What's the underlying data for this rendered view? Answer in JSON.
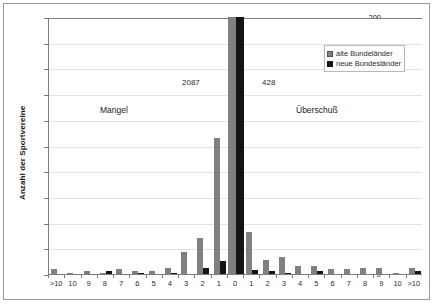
{
  "chart_data": {
    "type": "bar",
    "title": "",
    "xlabel": "",
    "ylabel": "Anzahl der Sportvereine",
    "ylim": [
      0,
      200
    ],
    "ytick_step": 20,
    "yticks": [
      "0",
      "20",
      "40",
      "60",
      "80",
      "100",
      "120",
      "140",
      "160",
      "180",
      "200"
    ],
    "grid": true,
    "legend_position": "top-right",
    "categories": [
      ">10",
      "10",
      "9",
      "8",
      "7",
      "6",
      "5",
      "4",
      "3",
      "2",
      "1",
      "0",
      "1",
      "2",
      "3",
      "4",
      "5",
      "6",
      "7",
      "8",
      "9",
      "10",
      ">10"
    ],
    "series": [
      {
        "name": "alte Bundeländer",
        "color": "#808080",
        "values": [
          4,
          1,
          2,
          1,
          4,
          2,
          2,
          5,
          17,
          28,
          106,
          2087,
          33,
          11,
          13,
          6,
          6,
          4,
          4,
          5,
          5,
          1,
          5
        ]
      },
      {
        "name": "neue Bundesländer",
        "color": "#141414",
        "values": [
          0,
          0,
          0,
          2,
          0,
          1,
          0,
          1,
          0,
          5,
          10,
          428,
          3,
          2,
          1,
          0,
          2,
          0,
          0,
          0,
          0,
          0,
          2
        ]
      }
    ],
    "annotations": [
      {
        "name": "mangel-label",
        "text": "Mangel"
      },
      {
        "name": "ueberschuss-label",
        "text": "Überschuß"
      },
      {
        "name": "value-label-alte-zero",
        "text": "2087"
      },
      {
        "name": "value-label-neue-zero",
        "text": "428"
      }
    ],
    "clipped_note": "center category 0 bars exceed axis maximum 200 and are clipped"
  },
  "legend": {
    "items": [
      {
        "label": "alte Bundeländer",
        "color": "#808080",
        "swatch": "legend-swatch-alte"
      },
      {
        "label": "neue Bundesländer",
        "color": "#141414",
        "swatch": "legend-swatch-neue"
      }
    ]
  },
  "axis": {
    "y_title": "Anzahl der Sportvereine",
    "y_ticks": [
      "200",
      "180",
      "160",
      "140",
      "120",
      "100",
      "80",
      "60",
      "40",
      "20",
      "0"
    ],
    "x_ticks": [
      ">10",
      "10",
      "9",
      "8",
      "7",
      "6",
      "5",
      "4",
      "3",
      "2",
      "1",
      "0",
      "1",
      "2",
      "3",
      "4",
      "5",
      "6",
      "7",
      "8",
      "9",
      "10",
      ">10"
    ]
  },
  "labels": {
    "mangel": "Mangel",
    "ueberschuss": "Überschuß",
    "value_2087": "2087",
    "value_428": "428"
  },
  "colors": {
    "series_alte": "#808080",
    "series_neue": "#141414",
    "grid": "#e3e3e3",
    "axis": "#7d7d7d",
    "frame": "#9a9a9a",
    "background": "#ffffff"
  }
}
